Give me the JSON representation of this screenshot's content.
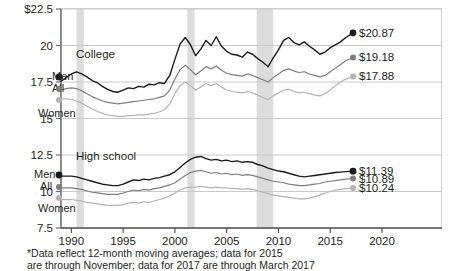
{
  "footnote": {
    "line1": "*Data reflect 12-month moving averages; data for 2015",
    "line2": "are through November; data for 2017 are through March 2017"
  },
  "axes": {
    "y_ticks": [
      "$22.5",
      "20",
      "17.5",
      "15",
      "12.5",
      "10",
      "7.5"
    ],
    "y_values": [
      22.5,
      20,
      17.5,
      15,
      12.5,
      10,
      7.5
    ],
    "x_ticks": [
      "1990",
      "1995",
      "2000",
      "2005",
      "2010",
      "2015",
      "2020"
    ],
    "x_values": [
      1990,
      1995,
      2000,
      2005,
      2010,
      2015,
      2020
    ],
    "ylim": [
      7.5,
      22.5
    ],
    "xlim": [
      1989,
      2020
    ]
  },
  "groups": [
    {
      "name": "college",
      "label": "College",
      "label_x": 76,
      "label_y": 58
    },
    {
      "name": "high-school",
      "label": "High school",
      "label_x": 76,
      "label_y": 160
    }
  ],
  "series_labels": [
    {
      "name": "college-men",
      "label": "Men",
      "x": 52,
      "y": 80,
      "dot_x": 59,
      "dot_y": 77,
      "color": "#1a1a1a"
    },
    {
      "name": "college-all",
      "label": "All",
      "x": 52,
      "y": 92,
      "dot_x": 59,
      "dot_y": 89,
      "color": "#7d7d7d"
    },
    {
      "name": "college-women",
      "label": "Women",
      "x": 38,
      "y": 117,
      "dot_x": 59,
      "dot_y": 100,
      "color": "#b4b4b4"
    },
    {
      "name": "hs-men",
      "label": "Men",
      "x": 34,
      "y": 178,
      "dot_x": 59,
      "dot_y": 175,
      "color": "#1a1a1a"
    },
    {
      "name": "hs-all",
      "label": "All",
      "x": 40,
      "y": 190,
      "dot_x": 59,
      "dot_y": 187,
      "color": "#7d7d7d"
    },
    {
      "name": "hs-women",
      "label": "Women",
      "x": 38,
      "y": 212,
      "dot_x": 59,
      "dot_y": 198,
      "color": "#b4b4b4"
    }
  ],
  "end_labels": [
    {
      "name": "college-men-value",
      "text": "$20.87",
      "color": "#1a1a1a"
    },
    {
      "name": "college-all-value",
      "text": "$19.18",
      "color": "#7d7d7d"
    },
    {
      "name": "college-women-value",
      "text": "$17.88",
      "color": "#b4b4b4"
    },
    {
      "name": "hs-men-value",
      "text": "$11.39",
      "color": "#1a1a1a"
    },
    {
      "name": "hs-all-value",
      "text": "$10.89",
      "color": "#7d7d7d"
    },
    {
      "name": "hs-women-value",
      "text": "$10.24",
      "color": "#b4b4b4"
    }
  ],
  "colors": {
    "men": "#1a1a1a",
    "all": "#7d7d7d",
    "women": "#b4b4b4",
    "recession_band": "#d6d6d6",
    "gridline": "#c9c9c9",
    "axis": "#6f6f6f",
    "frame": "#d0d0d0"
  },
  "recessions": [
    {
      "start": 1990.5,
      "end": 1991.2
    },
    {
      "start": 2001.2,
      "end": 2001.9
    },
    {
      "start": 2007.9,
      "end": 2009.5
    }
  ],
  "chart_data": {
    "type": "line",
    "title": "",
    "subtitle": "",
    "xlabel": "",
    "ylabel": "",
    "xlim": [
      1989,
      2020
    ],
    "ylim": [
      7.5,
      22.5
    ],
    "grid": true,
    "legend": "inline-labels",
    "note": "Median hourly wages in constant dollars, by education and gender; shaded bands mark recessions",
    "x": [
      1989.0,
      1989.5,
      1990.0,
      1990.5,
      1991.0,
      1991.5,
      1992.0,
      1992.5,
      1993.0,
      1993.5,
      1994.0,
      1994.5,
      1995.0,
      1995.5,
      1996.0,
      1996.5,
      1997.0,
      1997.5,
      1998.0,
      1998.5,
      1999.0,
      1999.5,
      2000.0,
      2000.5,
      2001.0,
      2001.5,
      2002.0,
      2002.5,
      2003.0,
      2003.5,
      2004.0,
      2004.5,
      2005.0,
      2005.5,
      2006.0,
      2006.5,
      2007.0,
      2007.5,
      2008.0,
      2008.5,
      2009.0,
      2009.5,
      2010.0,
      2010.5,
      2011.0,
      2011.5,
      2012.0,
      2012.5,
      2013.0,
      2013.5,
      2014.0,
      2014.5,
      2015.0,
      2015.5,
      2016.0,
      2016.5,
      2017.2
    ],
    "series": [
      {
        "name": "College Men",
        "group": "College",
        "color": "#1a1a1a",
        "end_value": 20.87,
        "values": [
          17.55,
          17.8,
          18.05,
          18.2,
          18.05,
          17.85,
          17.6,
          17.45,
          17.2,
          17.0,
          16.85,
          16.8,
          16.95,
          17.1,
          17.05,
          17.2,
          17.15,
          17.35,
          17.3,
          17.45,
          17.4,
          17.95,
          19.05,
          20.1,
          20.55,
          20.05,
          19.3,
          19.75,
          20.35,
          20.0,
          20.6,
          19.95,
          19.6,
          19.4,
          19.35,
          19.2,
          19.55,
          19.4,
          19.1,
          18.85,
          18.55,
          19.15,
          19.7,
          20.35,
          20.55,
          20.2,
          20.05,
          20.25,
          19.95,
          19.7,
          19.4,
          19.55,
          19.85,
          20.05,
          20.25,
          20.55,
          20.87
        ]
      },
      {
        "name": "College All",
        "group": "College",
        "color": "#7d7d7d",
        "end_value": 19.18,
        "values": [
          16.95,
          17.05,
          17.1,
          17.05,
          16.9,
          16.7,
          16.5,
          16.35,
          16.2,
          16.1,
          16.05,
          16.0,
          16.05,
          16.1,
          16.15,
          16.2,
          16.25,
          16.3,
          16.35,
          16.45,
          16.55,
          16.95,
          17.7,
          18.35,
          18.65,
          18.35,
          18.0,
          18.25,
          18.55,
          18.4,
          18.6,
          18.3,
          18.1,
          18.0,
          17.95,
          17.9,
          18.05,
          17.95,
          17.8,
          17.65,
          17.5,
          17.8,
          18.05,
          18.3,
          18.4,
          18.25,
          18.15,
          18.2,
          18.05,
          17.95,
          17.85,
          17.95,
          18.2,
          18.45,
          18.7,
          18.95,
          19.18
        ]
      },
      {
        "name": "College Women",
        "group": "College",
        "color": "#b4b4b4",
        "end_value": 17.88,
        "values": [
          16.35,
          16.35,
          16.3,
          16.2,
          16.05,
          15.85,
          15.65,
          15.5,
          15.35,
          15.25,
          15.2,
          15.15,
          15.15,
          15.2,
          15.2,
          15.25,
          15.25,
          15.3,
          15.35,
          15.45,
          15.6,
          16.0,
          16.7,
          17.25,
          17.5,
          17.25,
          16.95,
          17.15,
          17.4,
          17.25,
          17.4,
          17.15,
          16.95,
          16.85,
          16.8,
          16.75,
          16.85,
          16.75,
          16.6,
          16.45,
          16.3,
          16.55,
          16.75,
          16.95,
          17.0,
          16.85,
          16.75,
          16.8,
          16.7,
          16.6,
          16.55,
          16.7,
          16.95,
          17.25,
          17.5,
          17.7,
          17.88
        ]
      },
      {
        "name": "High school Men",
        "group": "High school",
        "color": "#1a1a1a",
        "end_value": 11.39,
        "values": [
          11.05,
          11.05,
          11.05,
          11.0,
          10.9,
          10.8,
          10.7,
          10.6,
          10.5,
          10.45,
          10.4,
          10.4,
          10.5,
          10.65,
          10.8,
          10.75,
          10.85,
          10.8,
          10.9,
          10.95,
          11.05,
          11.15,
          11.35,
          11.65,
          11.95,
          12.2,
          12.35,
          12.4,
          12.25,
          12.15,
          12.2,
          12.1,
          12.15,
          12.05,
          12.1,
          12.0,
          12.05,
          12.0,
          11.85,
          11.75,
          11.6,
          11.5,
          11.4,
          11.35,
          11.25,
          11.15,
          11.05,
          11.0,
          11.05,
          11.1,
          11.15,
          11.2,
          11.25,
          11.3,
          11.33,
          11.36,
          11.39
        ]
      },
      {
        "name": "High school All",
        "group": "High school",
        "color": "#7d7d7d",
        "end_value": 10.89,
        "values": [
          10.25,
          10.25,
          10.25,
          10.2,
          10.15,
          10.05,
          9.95,
          9.9,
          9.85,
          9.8,
          9.8,
          9.8,
          9.9,
          10.0,
          10.1,
          10.05,
          10.15,
          10.1,
          10.2,
          10.25,
          10.35,
          10.45,
          10.6,
          10.85,
          11.1,
          11.3,
          11.4,
          11.45,
          11.35,
          11.25,
          11.3,
          11.2,
          11.25,
          11.15,
          11.2,
          11.1,
          11.15,
          11.1,
          11.0,
          10.9,
          10.8,
          10.7,
          10.65,
          10.6,
          10.5,
          10.45,
          10.4,
          10.4,
          10.45,
          10.5,
          10.55,
          10.65,
          10.7,
          10.75,
          10.8,
          10.85,
          10.89
        ]
      },
      {
        "name": "High school Women",
        "group": "High school",
        "color": "#b4b4b4",
        "end_value": 10.24,
        "values": [
          9.45,
          9.45,
          9.45,
          9.4,
          9.35,
          9.25,
          9.2,
          9.15,
          9.1,
          9.05,
          9.05,
          9.05,
          9.1,
          9.2,
          9.25,
          9.2,
          9.3,
          9.25,
          9.35,
          9.45,
          9.55,
          9.7,
          9.9,
          10.1,
          10.25,
          10.3,
          10.3,
          10.35,
          10.3,
          10.25,
          10.3,
          10.25,
          10.25,
          10.2,
          10.2,
          10.15,
          10.2,
          10.15,
          10.05,
          9.95,
          9.85,
          9.75,
          9.7,
          9.65,
          9.6,
          9.55,
          9.5,
          9.5,
          9.55,
          9.65,
          9.75,
          9.9,
          10.0,
          10.1,
          10.15,
          10.2,
          10.24
        ]
      }
    ]
  }
}
